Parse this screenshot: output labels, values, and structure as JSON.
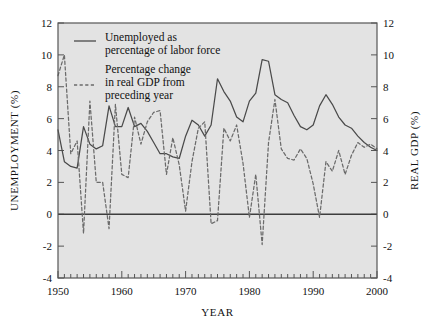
{
  "chart_data": {
    "type": "line",
    "title": "",
    "xlabel": "YEAR",
    "ylabel": "UNEMPLOYMENT (%)",
    "y2label": "REAL GDP (%)",
    "xlim": [
      1950,
      2000
    ],
    "ylim": [
      -4,
      12
    ],
    "y2lim": [
      -4,
      12
    ],
    "xticks": [
      1950,
      1960,
      1970,
      1980,
      1990,
      2000
    ],
    "xtick_labels": [
      "1950",
      "1960",
      "1970",
      "1980",
      "1990",
      "2000"
    ],
    "xminor_step": 1,
    "yticks": [
      -4,
      -2,
      0,
      2,
      4,
      6,
      8,
      10,
      12
    ],
    "ytick_labels": [
      "-4",
      "-2",
      "0",
      "2",
      "4",
      "6",
      "8",
      "10",
      "12"
    ],
    "y2ticks": [
      -4,
      -2,
      0,
      2,
      4,
      6,
      8,
      10,
      12
    ],
    "y2tick_labels": [
      "-4",
      "-2",
      "0",
      "2",
      "4",
      "6",
      "8",
      "10",
      "12"
    ],
    "grid": false,
    "zero_line": 0,
    "plot_bgcolor": "#e3e3e3",
    "frame_color": "#555555",
    "legend_position": "top-left",
    "x": [
      1950,
      1951,
      1952,
      1953,
      1954,
      1955,
      1956,
      1957,
      1958,
      1959,
      1960,
      1961,
      1962,
      1963,
      1964,
      1965,
      1966,
      1967,
      1968,
      1969,
      1970,
      1971,
      1972,
      1973,
      1974,
      1975,
      1976,
      1977,
      1978,
      1979,
      1980,
      1981,
      1982,
      1983,
      1984,
      1985,
      1986,
      1987,
      1988,
      1989,
      1990,
      1991,
      1992,
      1993,
      1994,
      1995,
      1996,
      1997,
      1998,
      1999,
      2000
    ],
    "series": [
      {
        "name": "Unemployed as percentage of labor force",
        "style": "solid",
        "axis": "left",
        "color": "#4a4a4a",
        "values": [
          5.3,
          3.3,
          3.0,
          2.9,
          5.5,
          4.4,
          4.1,
          4.3,
          6.8,
          5.5,
          5.5,
          6.7,
          5.5,
          5.7,
          5.2,
          4.5,
          3.8,
          3.8,
          3.6,
          3.5,
          4.9,
          5.9,
          5.6,
          4.9,
          5.6,
          8.5,
          7.7,
          7.1,
          6.1,
          5.8,
          7.1,
          7.6,
          9.7,
          9.6,
          7.5,
          7.2,
          7.0,
          6.2,
          5.5,
          5.3,
          5.6,
          6.8,
          7.5,
          6.9,
          6.1,
          5.6,
          5.4,
          4.9,
          4.5,
          4.2,
          4.0
        ]
      },
      {
        "name": "Percentage change in real GDP from preceding year",
        "style": "dashed",
        "axis": "right",
        "color": "#6b6b6b",
        "values": [
          8.7,
          10.0,
          3.8,
          4.6,
          -1.2,
          7.1,
          2.0,
          2.0,
          -0.9,
          6.9,
          2.5,
          2.3,
          6.1,
          4.4,
          5.8,
          6.4,
          6.5,
          2.5,
          4.8,
          3.1,
          0.2,
          3.3,
          5.4,
          5.8,
          -0.6,
          -0.4,
          5.4,
          4.6,
          5.6,
          3.2,
          -0.2,
          2.5,
          -1.9,
          4.5,
          7.2,
          4.1,
          3.5,
          3.4,
          4.1,
          3.5,
          1.9,
          -0.2,
          3.3,
          2.7,
          4.0,
          2.5,
          3.7,
          4.5,
          4.2,
          4.4,
          4.1
        ]
      }
    ],
    "legend": [
      {
        "style": "solid",
        "lines": [
          "Unemployed as",
          "percentage of labor force"
        ]
      },
      {
        "style": "dashed",
        "lines": [
          "Percentage change",
          "in real GDP from",
          "preceding year"
        ]
      }
    ]
  }
}
